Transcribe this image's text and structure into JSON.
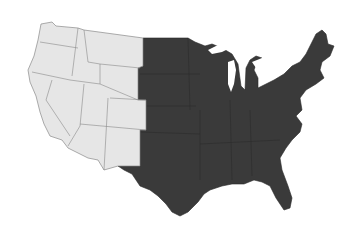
{
  "map": {
    "title": "United States regions map",
    "regions": [
      {
        "name": "West",
        "fill": "#e6e6e6",
        "stroke": "#8a8a8a"
      },
      {
        "name": "East",
        "fill": "#3a3a3a",
        "stroke": "#222222"
      }
    ],
    "background": "#ffffff"
  }
}
